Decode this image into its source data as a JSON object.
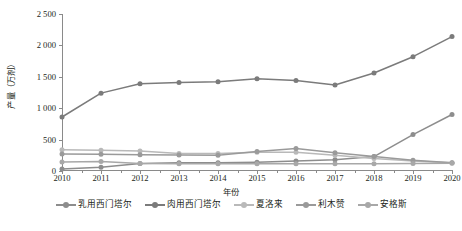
{
  "chart": {
    "type": "line",
    "ylabel": "产量（万剂）",
    "xlabel": "年份",
    "ytick_labels": [
      "0",
      "500",
      "1 000",
      "1 500",
      "2 000",
      "2 500"
    ]
  },
  "chart_data": {
    "type": "line",
    "title": "",
    "xlabel": "年份",
    "ylabel": "产量（万剂）",
    "xlim": [
      2010,
      2020
    ],
    "ylim": [
      0,
      2500
    ],
    "yticks": [
      0,
      500,
      1000,
      1500,
      2000,
      2500
    ],
    "ytick_labels": [
      "0",
      "500",
      "1 000",
      "1 500",
      "2 000",
      "2 500"
    ],
    "grid": false,
    "legend_position": "bottom",
    "categories": [
      2010,
      2011,
      2012,
      2013,
      2014,
      2015,
      2016,
      2017,
      2018,
      2019,
      2020
    ],
    "xtick_labels": [
      "2010",
      "2011",
      "2012",
      "2013",
      "2014",
      "2015",
      "2016",
      "2017",
      "2018",
      "2019",
      "2020"
    ],
    "series": [
      {
        "name": "乳用西门塔尔",
        "color": "#8d8d8d",
        "values": [
          30,
          60,
          120,
          130,
          130,
          140,
          160,
          180,
          230,
          580,
          900
        ]
      },
      {
        "name": "肉用西门塔尔",
        "color": "#7b7b7b",
        "values": [
          860,
          1240,
          1390,
          1410,
          1420,
          1470,
          1440,
          1370,
          1560,
          1820,
          2140
        ]
      },
      {
        "name": "夏洛来",
        "color": "#b9b9b9",
        "values": [
          340,
          330,
          320,
          280,
          280,
          300,
          300,
          250,
          200,
          160,
          130
        ]
      },
      {
        "name": "利木赞",
        "color": "#9a9a9a",
        "values": [
          270,
          265,
          260,
          255,
          250,
          310,
          360,
          290,
          230,
          170,
          130
        ]
      },
      {
        "name": "安格斯",
        "color": "#a8a8a8",
        "values": [
          145,
          150,
          120,
          115,
          115,
          115,
          115,
          115,
          115,
          120,
          125
        ]
      }
    ]
  },
  "legend": {
    "items": [
      {
        "label": "乳用西门塔尔",
        "color": "#8d8d8d"
      },
      {
        "label": "肉用西门塔尔",
        "color": "#7b7b7b"
      },
      {
        "label": "夏洛来",
        "color": "#b9b9b9"
      },
      {
        "label": "利木赞",
        "color": "#9a9a9a"
      },
      {
        "label": "安格斯",
        "color": "#a8a8a8"
      }
    ]
  }
}
